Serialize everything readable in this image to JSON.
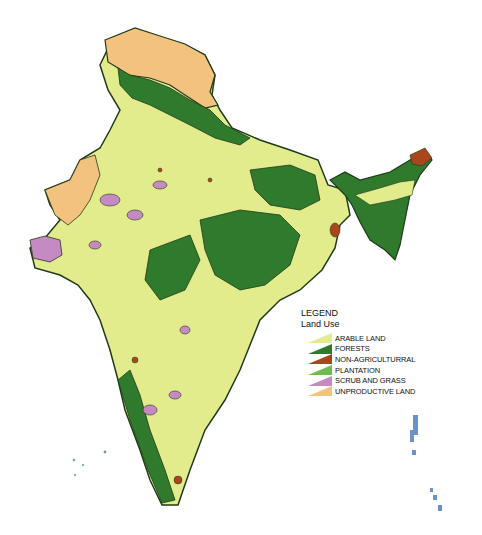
{
  "legend": {
    "title": "LEGEND",
    "subtitle": "Land Use",
    "items": [
      {
        "label": "ARABLE LAND",
        "color": "#e3ec8c"
      },
      {
        "label": "FORESTS",
        "color": "#2f7a2c"
      },
      {
        "label": "NON-AGRICULTURRAL",
        "color": "#a8461e"
      },
      {
        "label": "PLANTATION",
        "color": "#6cbd4e"
      },
      {
        "label": "SCRUB AND GRASS",
        "color": "#c58ac3"
      },
      {
        "label": "UNPRODUCTIVE LAND",
        "color": "#f3c27e"
      }
    ]
  },
  "colors": {
    "arable": "#e3ec8c",
    "forest": "#2f7a2c",
    "non_agri": "#a8461e",
    "plantation": "#6cbd4e",
    "scrub": "#c58ac3",
    "unproductive": "#f3c27e",
    "islands": "#6a94c8",
    "border": "#1f3a1a"
  }
}
